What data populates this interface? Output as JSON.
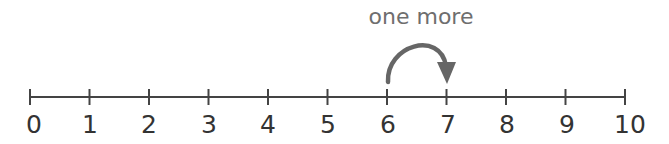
{
  "diagram": {
    "type": "number-line",
    "caption": "one more",
    "range": [
      0,
      10
    ],
    "step": 1,
    "tick_labels": [
      "0",
      "1",
      "2",
      "3",
      "4",
      "5",
      "6",
      "7",
      "8",
      "9",
      "10"
    ],
    "jump": {
      "from": 6,
      "to": 7,
      "label": "one more"
    },
    "colors": {
      "line": "#444444",
      "arrow": "#666666",
      "text": "#333333",
      "caption": "#6e6e6e"
    }
  }
}
